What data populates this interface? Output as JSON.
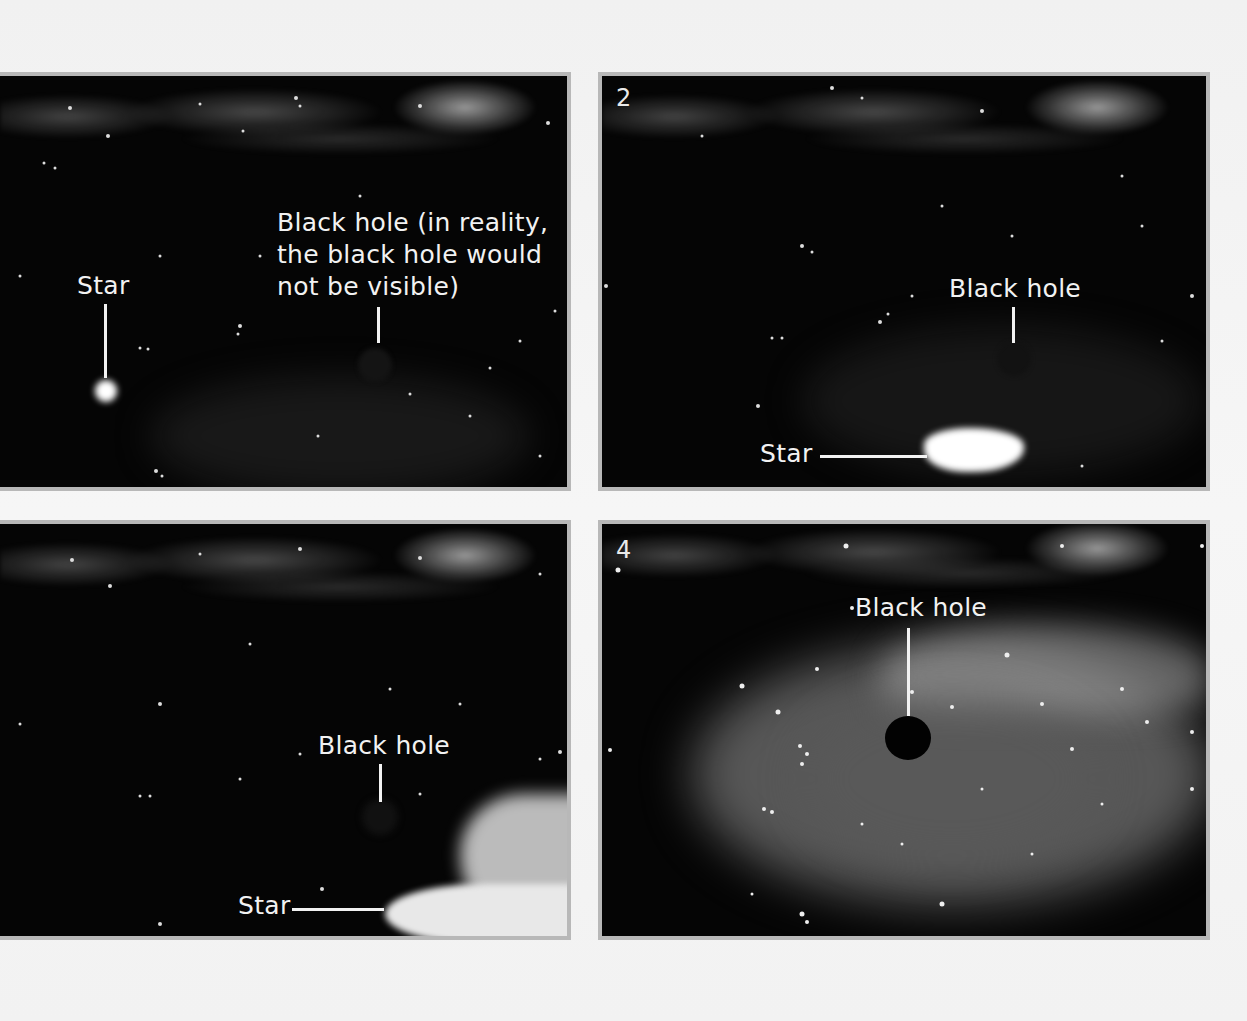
{
  "figure": {
    "panels": [
      {
        "index": 1,
        "number_label": "",
        "labels": {
          "star": "Star",
          "black_hole_line1": "Black hole (in reality,",
          "black_hole_line2": "the black hole would",
          "black_hole_line3": "not be visible)"
        }
      },
      {
        "index": 2,
        "number_label": "2",
        "labels": {
          "black_hole": "Black hole",
          "star": "Star"
        }
      },
      {
        "index": 3,
        "number_label": "",
        "labels": {
          "black_hole": "Black hole",
          "star": "Star"
        }
      },
      {
        "index": 4,
        "number_label": "4",
        "labels": {
          "black_hole": "Black hole"
        }
      }
    ],
    "colors": {
      "page_background": "#f3f3f3",
      "panel_border": "#b8b8b8",
      "space": "#050505",
      "label_text": "#f2f2f2"
    }
  }
}
